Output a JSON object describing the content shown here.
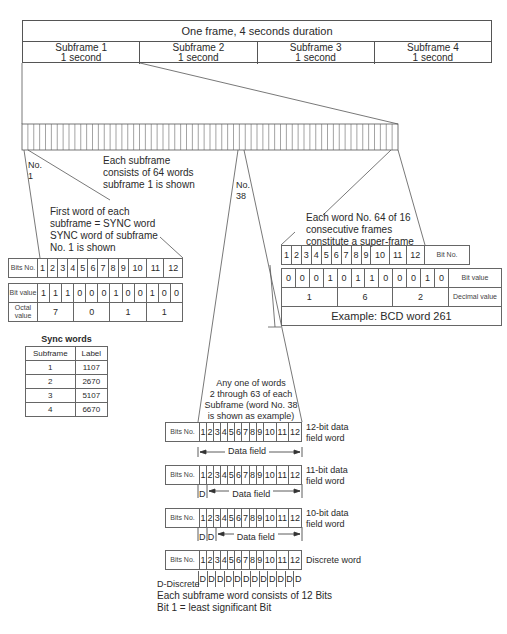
{
  "frame": {
    "title": "One frame, 4 seconds duration",
    "subframes": [
      {
        "name": "Subframe 1",
        "duration": "1 second"
      },
      {
        "name": "Subframe 2",
        "duration": "1 second"
      },
      {
        "name": "Subframe 3",
        "duration": "1 second"
      },
      {
        "name": "Subframe 4",
        "duration": "1 second"
      }
    ]
  },
  "word_bar": {
    "word_count": 64,
    "label_no1": "No.\n1",
    "label_no38": "No.\n38",
    "note_line1": "Each subframe",
    "note_line2": "consists of 64 words",
    "note_line3": "subframe 1 is shown"
  },
  "sync_word": {
    "note_line1": "First word of each",
    "note_line2": "subframe = SYNC word",
    "note_line3": "SYNC word of subframe",
    "note_line4": "No. 1 is shown",
    "bits_label": "Bits No.",
    "bit_numbers": [
      "1",
      "2",
      "3",
      "4",
      "5",
      "6",
      "7",
      "8",
      "9",
      "10",
      "11",
      "12"
    ],
    "bit_value_label": "Bit value",
    "bit_values": [
      "1",
      "1",
      "1",
      "0",
      "0",
      "0",
      "1",
      "0",
      "0",
      "1",
      "0",
      "0"
    ],
    "octal_label": "Octal value",
    "octal_values": [
      "7",
      "0",
      "1",
      "1"
    ]
  },
  "sync_words_table": {
    "title": "Sync words",
    "headers": [
      "Subframe",
      "Label"
    ],
    "rows": [
      [
        "1",
        "1107"
      ],
      [
        "2",
        "2670"
      ],
      [
        "3",
        "5107"
      ],
      [
        "4",
        "6670"
      ]
    ]
  },
  "superframe": {
    "note_line1": "Each word No. 64 of 16",
    "note_line2": "consecutive frames",
    "note_line3": "constitute a super-frame",
    "bit_numbers": [
      "1",
      "2",
      "3",
      "4",
      "5",
      "6",
      "7",
      "8",
      "9",
      "10",
      "11",
      "12"
    ],
    "bit_no_label": "Bit No.",
    "bit_values": [
      "0",
      "0",
      "0",
      "1",
      "0",
      "1",
      "1",
      "0",
      "0",
      "0",
      "1",
      "0"
    ],
    "bit_value_label": "Bit value",
    "decimal_values": [
      "1",
      "6",
      "2"
    ],
    "decimal_label": "Decimal value",
    "example": "Example: BCD word 261"
  },
  "data_words": {
    "note_line1": "Any one of words",
    "note_line2": "2 through 63 of each",
    "note_line3": "Subframe (word No. 38",
    "note_line4": "is shown as example)",
    "bits_label": "Bits No.",
    "bit_numbers": [
      "1",
      "2",
      "3",
      "4",
      "5",
      "6",
      "7",
      "8",
      "9",
      "10",
      "11",
      "12"
    ],
    "data_field_label": "Data field",
    "discrete_marker": "D",
    "rows": [
      {
        "type_line1": "12-bit data",
        "type_line2": "field word",
        "discretes": 0
      },
      {
        "type_line1": "11-bit data",
        "type_line2": "field word",
        "discretes": 1
      },
      {
        "type_line1": "10-bit data",
        "type_line2": "field word",
        "discretes": 2
      },
      {
        "type_line1": "Discrete word",
        "type_line2": "",
        "discretes": 12
      }
    ]
  },
  "legend": {
    "line1": "D-Discrete",
    "line2": "Each subframe word consists of 12 Bits",
    "line3": "Bit 1 = least significant Bit"
  }
}
